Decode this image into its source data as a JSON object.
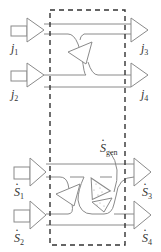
{
  "diagram": {
    "type": "control-volume flow diagram",
    "boundary": "dashed control volume",
    "top_section": {
      "inputs": [
        {
          "symbol": "j",
          "subscript": "1"
        },
        {
          "symbol": "j",
          "subscript": "2"
        }
      ],
      "outputs": [
        {
          "symbol": "j",
          "subscript": "3"
        },
        {
          "symbol": "j",
          "subscript": "4"
        }
      ]
    },
    "bottom_section": {
      "inputs": [
        {
          "symbol": "S",
          "subscript": "1",
          "dot": true
        },
        {
          "symbol": "S",
          "subscript": "2",
          "dot": true
        }
      ],
      "outputs": [
        {
          "symbol": "S",
          "subscript": "3",
          "dot": true
        },
        {
          "symbol": "S",
          "subscript": "4",
          "dot": true
        }
      ],
      "generation": {
        "symbol": "S",
        "subscript": "gen",
        "dot": true
      }
    },
    "colors": {
      "line": "#8a8a8a",
      "dash": "#333333",
      "text": "#333333"
    }
  }
}
